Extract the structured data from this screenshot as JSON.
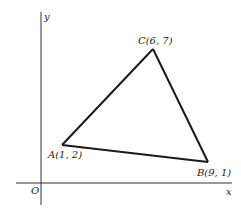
{
  "diagram": {
    "axes": {
      "x_label": "x",
      "y_label": "y",
      "origin_label": "O"
    },
    "points": [
      {
        "name": "A",
        "x": 1,
        "y": 2,
        "label": "A(1, 2)"
      },
      {
        "name": "B",
        "x": 9,
        "y": 1,
        "label": "B(9, 1)"
      },
      {
        "name": "C",
        "x": 6,
        "y": 7,
        "label": "C(6, 7)"
      }
    ],
    "edges": [
      [
        "A",
        "C"
      ],
      [
        "C",
        "B"
      ],
      [
        "B",
        "A"
      ]
    ],
    "colors": {
      "line": "#1a1a1a",
      "axis": "#333333",
      "background": "#ffffff"
    }
  }
}
